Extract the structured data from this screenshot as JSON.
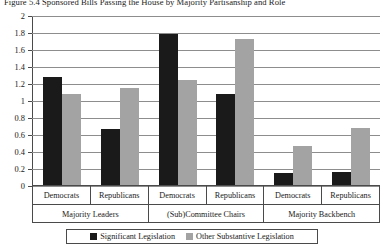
{
  "figure": {
    "title": "Figure 5.4  Sponsored Bills Passing the House by Majority Partisanship and Role"
  },
  "legend": {
    "items": [
      {
        "label": "Significant Legislation",
        "color": "#1a1a1a",
        "swatch": "black-square-icon"
      },
      {
        "label": "Other Substantive Legislation",
        "color": "#a3a3a3",
        "swatch": "gray-square-icon"
      }
    ]
  },
  "axis": {
    "y_ticks": [
      "2",
      "1.8",
      "1.6",
      "1.4",
      "1.2",
      "1",
      "0.8",
      "0.6",
      "0.4",
      "0.2",
      "0"
    ]
  },
  "chart_data": {
    "type": "bar",
    "title": "Figure 5.4  Sponsored Bills Passing the House by Majority Partisanship and Role",
    "xlabel": "",
    "ylabel": "",
    "ylim": [
      0,
      2
    ],
    "ytick_step": 0.2,
    "grid": true,
    "legend_position": "bottom",
    "group_labels": [
      "Majority Leaders",
      "(Sub)Committee Chairs",
      "Majority Backbench"
    ],
    "categories": [
      "Majority Leaders / Democrats",
      "Majority Leaders / Republicans",
      "(Sub)Committee Chairs / Democrats",
      "(Sub)Committee Chairs / Republicans",
      "Majority Backbench / Democrats",
      "Majority Backbench / Republicans"
    ],
    "party_labels": [
      "Democrats",
      "Republicans"
    ],
    "series": [
      {
        "name": "Significant Legislation",
        "color": "#1a1a1a",
        "values": [
          1.27,
          0.66,
          1.78,
          1.07,
          0.14,
          0.15
        ]
      },
      {
        "name": "Other Substantive Legislation",
        "color": "#a3a3a3",
        "values": [
          1.07,
          1.14,
          1.24,
          1.72,
          0.46,
          0.67
        ]
      }
    ],
    "groups": [
      {
        "label": "Majority Leaders",
        "parties": [
          {
            "party": "Democrats",
            "Significant Legislation": 1.27,
            "Other Substantive Legislation": 1.07
          },
          {
            "party": "Republicans",
            "Significant Legislation": 0.66,
            "Other Substantive Legislation": 1.14
          }
        ]
      },
      {
        "label": "(Sub)Committee Chairs",
        "parties": [
          {
            "party": "Democrats",
            "Significant Legislation": 1.78,
            "Other Substantive Legislation": 1.24
          },
          {
            "party": "Republicans",
            "Significant Legislation": 1.07,
            "Other Substantive Legislation": 1.72
          }
        ]
      },
      {
        "label": "Majority Backbench",
        "parties": [
          {
            "party": "Democrats",
            "Significant Legislation": 0.14,
            "Other Substantive Legislation": 0.46
          },
          {
            "party": "Republicans",
            "Significant Legislation": 0.15,
            "Other Substantive Legislation": 0.67
          }
        ]
      }
    ]
  }
}
